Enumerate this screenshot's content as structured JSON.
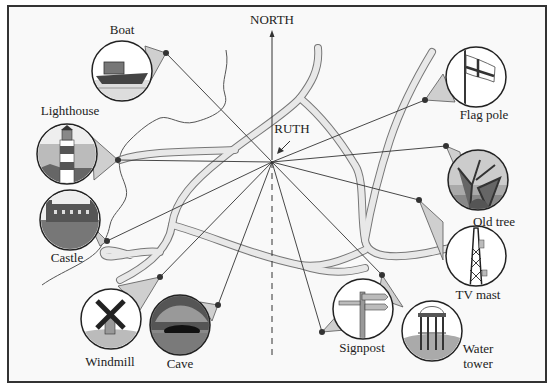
{
  "diagram": {
    "north_label": "NORTH",
    "center_label": "RUTH",
    "colors": {
      "frame": "#333333",
      "background": "#f9f9f9",
      "road_fill": "#e8e8e8",
      "road_edge": "#777777",
      "line": "#333333",
      "callout": "#cfcfcf",
      "circle_fill": "#ffffff"
    },
    "landmarks": [
      {
        "name": "Boat",
        "label": "Boat"
      },
      {
        "name": "Lighthouse",
        "label": "Lighthouse"
      },
      {
        "name": "Castle",
        "label": "Castle"
      },
      {
        "name": "Windmill",
        "label": "Windmill"
      },
      {
        "name": "Cave",
        "label": "Cave"
      },
      {
        "name": "Signpost",
        "label": "Signpost"
      },
      {
        "name": "Water tower",
        "label_line1": "Water",
        "label_line2": "tower"
      },
      {
        "name": "TV mast",
        "label": "TV mast"
      },
      {
        "name": "Old tree",
        "label": "Old tree"
      },
      {
        "name": "Flag pole",
        "label": "Flag pole"
      }
    ]
  }
}
